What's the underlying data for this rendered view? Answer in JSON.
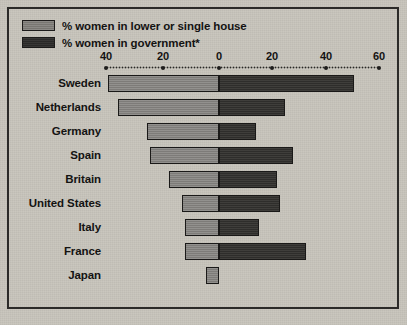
{
  "chart_data": {
    "type": "bar",
    "orientation": "horizontal",
    "layout": "diverging-bidirectional",
    "title": "",
    "xlabel": "",
    "ylabel": "",
    "grid": false,
    "legend_position": "top-left",
    "axis": {
      "tick_labels": [
        "40",
        "20",
        "0",
        "20",
        "40",
        "60"
      ],
      "tick_values": [
        -40,
        -20,
        0,
        20,
        40,
        60
      ],
      "xlim": [
        -45,
        62
      ],
      "left_axis_direction": "decreasing",
      "units": "percent"
    },
    "legend": [
      {
        "key": "lower_house",
        "label": "% women in lower or single house",
        "swatch": "light"
      },
      {
        "key": "government",
        "label": "% women in government*",
        "swatch": "dark"
      }
    ],
    "series": [
      {
        "name": "% women in lower or single house",
        "side": "left",
        "swatch": "light",
        "values": [
          42,
          38,
          27,
          26,
          19,
          14,
          13,
          13,
          5
        ]
      },
      {
        "name": "% women in government*",
        "side": "right",
        "swatch": "dark",
        "values": [
          51,
          25,
          14,
          28,
          22,
          23,
          15,
          33,
          0
        ]
      }
    ],
    "categories": [
      "Sweden",
      "Netherlands",
      "Germany",
      "Spain",
      "Britain",
      "United States",
      "Italy",
      "France",
      "Japan"
    ],
    "rows": [
      {
        "country": "Sweden",
        "lower_house": 42,
        "government": 51
      },
      {
        "country": "Netherlands",
        "lower_house": 38,
        "government": 25
      },
      {
        "country": "Germany",
        "lower_house": 27,
        "government": 14
      },
      {
        "country": "Spain",
        "lower_house": 26,
        "government": 28
      },
      {
        "country": "Britain",
        "lower_house": 19,
        "government": 22
      },
      {
        "country": "United States",
        "lower_house": 14,
        "government": 23
      },
      {
        "country": "Italy",
        "lower_house": 13,
        "government": 15
      },
      {
        "country": "France",
        "lower_house": 13,
        "government": 33
      },
      {
        "country": "Japan",
        "lower_house": 5,
        "government": 0
      }
    ],
    "colors": {
      "background": "#c8c5bc",
      "light_bar": "#858380",
      "dark_bar": "#33322f",
      "text": "#141312",
      "frame": "#2b2a28"
    }
  }
}
